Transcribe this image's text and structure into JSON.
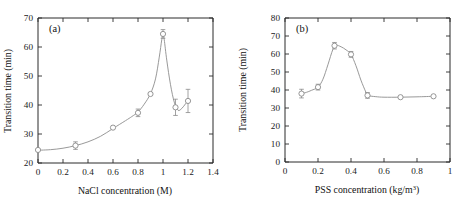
{
  "figure": {
    "panels": [
      "a",
      "b"
    ]
  },
  "chart_data": [
    {
      "type": "scatter",
      "panel_label": "(a)",
      "title": "",
      "xlabel": "NaCl concentration (M)",
      "ylabel": "Transition time (min)",
      "xlim": [
        0,
        1.4
      ],
      "ylim": [
        20,
        70
      ],
      "xticks": [
        0,
        0.2,
        0.4,
        0.6,
        0.8,
        1,
        1.2,
        1.4
      ],
      "xticklabels": [
        "0",
        "0.2",
        "0.4",
        "0.6",
        "0.8",
        "1",
        "1.2",
        "1.4"
      ],
      "yticks": [
        20,
        30,
        40,
        50,
        60,
        70
      ],
      "yticklabels": [
        "20",
        "30",
        "40",
        "50",
        "60",
        "70"
      ],
      "grid": false,
      "legend": "none",
      "marker": "open-circle",
      "x": [
        0,
        0.3,
        0.6,
        0.8,
        0.9,
        1.0,
        1.1,
        1.2
      ],
      "y": [
        24.5,
        26.0,
        32.2,
        37.3,
        43.8,
        64.5,
        39.2,
        41.4
      ],
      "yerr": [
        0.0,
        1.3,
        0.0,
        1.3,
        0.0,
        1.5,
        2.8,
        4.0
      ],
      "fit_curve": [
        [
          0.0,
          24.4
        ],
        [
          0.1,
          24.6
        ],
        [
          0.2,
          25.1
        ],
        [
          0.3,
          26.0
        ],
        [
          0.4,
          27.3
        ],
        [
          0.5,
          29.2
        ],
        [
          0.6,
          31.9
        ],
        [
          0.7,
          34.6
        ],
        [
          0.75,
          36.0
        ],
        [
          0.8,
          37.6
        ],
        [
          0.85,
          40.3
        ],
        [
          0.9,
          43.9
        ],
        [
          0.94,
          49.0
        ],
        [
          0.97,
          56.5
        ],
        [
          0.99,
          62.5
        ],
        [
          1.0,
          64.8
        ],
        [
          1.01,
          62.5
        ],
        [
          1.03,
          55.5
        ],
        [
          1.06,
          47.0
        ],
        [
          1.09,
          41.0
        ],
        [
          1.12,
          38.2
        ],
        [
          1.15,
          38.8
        ],
        [
          1.18,
          40.4
        ],
        [
          1.2,
          41.4
        ]
      ]
    },
    {
      "type": "scatter",
      "panel_label": "(b)",
      "title": "",
      "xlabel": "PSS concentration (kg/m³)",
      "xlabel_base": "PSS concentration (kg/m",
      "xlabel_sup": "3",
      "xlabel_tail": ")",
      "ylabel": "Transition time (min)",
      "xlim": [
        0,
        1
      ],
      "ylim": [
        0,
        80
      ],
      "xticks": [
        0,
        0.2,
        0.4,
        0.6,
        0.8,
        1
      ],
      "xticklabels": [
        "0",
        "0.2",
        "0.4",
        "0.6",
        "0.8",
        "1"
      ],
      "yticks": [
        0,
        10,
        20,
        30,
        40,
        50,
        60,
        70,
        80
      ],
      "yticklabels": [
        "0",
        "10",
        "20",
        "30",
        "40",
        "50",
        "60",
        "70",
        "80"
      ],
      "grid": false,
      "legend": "none",
      "marker": "open-circle",
      "x": [
        0.1,
        0.2,
        0.3,
        0.4,
        0.5,
        0.7,
        0.9
      ],
      "y": [
        38.0,
        41.6,
        64.6,
        59.8,
        37.0,
        36.0,
        36.5
      ],
      "yerr": [
        2.4,
        1.6,
        1.8,
        1.6,
        1.6,
        0.0,
        0.0
      ],
      "fit_curve": [
        [
          0.1,
          38.0
        ],
        [
          0.13,
          38.7
        ],
        [
          0.16,
          39.8
        ],
        [
          0.2,
          41.6
        ],
        [
          0.23,
          46.0
        ],
        [
          0.26,
          54.0
        ],
        [
          0.29,
          62.5
        ],
        [
          0.31,
          64.8
        ],
        [
          0.34,
          64.0
        ],
        [
          0.37,
          62.3
        ],
        [
          0.4,
          59.8
        ],
        [
          0.43,
          53.5
        ],
        [
          0.46,
          45.5
        ],
        [
          0.49,
          38.8
        ],
        [
          0.5,
          37.0
        ],
        [
          0.55,
          36.3
        ],
        [
          0.6,
          36.0
        ],
        [
          0.7,
          36.0
        ],
        [
          0.8,
          36.2
        ],
        [
          0.9,
          36.5
        ]
      ]
    }
  ],
  "colors": {
    "axis": "#2b2b2b",
    "text": "#111111",
    "data": "#8a8a8a",
    "background": "#ffffff"
  }
}
